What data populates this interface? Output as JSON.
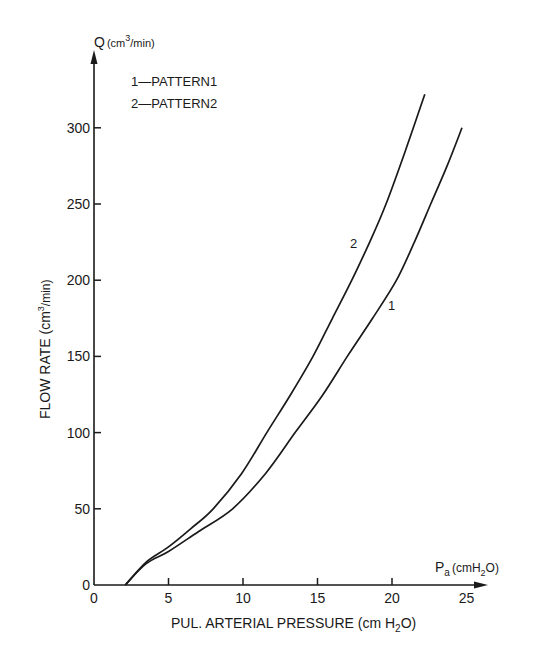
{
  "chart_data": {
    "type": "line",
    "title": "",
    "xlabel": "PUL. ARTERIAL PRESSURE (cm H2O)",
    "ylabel": "FLOW RATE (cm3/min)",
    "x_axis_end_label": "Pa (cmH2O)",
    "y_axis_end_label": "Q (cm3/min)",
    "xlim": [
      0,
      26
    ],
    "ylim": [
      0,
      340
    ],
    "x_ticks": [
      0,
      5,
      10,
      15,
      20,
      25
    ],
    "y_ticks": [
      0,
      50,
      100,
      150,
      200,
      250,
      300
    ],
    "grid": false,
    "legend_position": "upper-left",
    "legend": [
      {
        "key": "1",
        "label": "PATTERN1"
      },
      {
        "key": "2",
        "label": "PATTERN2"
      }
    ],
    "series": [
      {
        "name": "PATTERN1",
        "curve_label": "1",
        "x": [
          2.1,
          3.5,
          5,
          7,
          9.3,
          11.5,
          13.5,
          15.3,
          17.0,
          18.7,
          20.3,
          21.5,
          22.6,
          23.7,
          24.7
        ],
        "y": [
          0,
          14,
          22,
          35,
          50,
          73,
          100,
          124,
          150,
          175,
          200,
          225,
          250,
          275,
          300
        ]
      },
      {
        "name": "PATTERN2",
        "curve_label": "2",
        "x": [
          2.1,
          3.5,
          5,
          6.5,
          8.0,
          9.9,
          11.6,
          13.2,
          14.7,
          16.0,
          17.3,
          18.5,
          19.6,
          20.9,
          22.2
        ],
        "y": [
          0,
          15,
          25,
          37,
          50,
          73,
          100,
          125,
          150,
          175,
          200,
          225,
          250,
          285,
          322
        ]
      }
    ]
  },
  "labels": {
    "y_axis_q": "Q",
    "y_axis_unit_open": "(cm",
    "y_axis_unit_sup": "3",
    "y_axis_unit_close": "/min)",
    "x_axis_p": "P",
    "x_axis_p_sub": "a",
    "x_axis_unit_open": "(cmH",
    "x_axis_unit_sub": "2",
    "x_axis_unit_close": "O)",
    "xlabel_main": "PUL. ARTERIAL PRESSURE (cm H",
    "xlabel_sub": "2",
    "xlabel_end": "O)",
    "ylabel_main": "FLOW RATE (cm",
    "ylabel_sup": "3",
    "ylabel_end": "/min)",
    "legend_1": "1—PATTERN1",
    "legend_2": "2—PATTERN2",
    "curve_label_1": "1",
    "curve_label_2": "2"
  },
  "colors": {
    "ink": "#1a1a1a",
    "background": "#ffffff"
  }
}
